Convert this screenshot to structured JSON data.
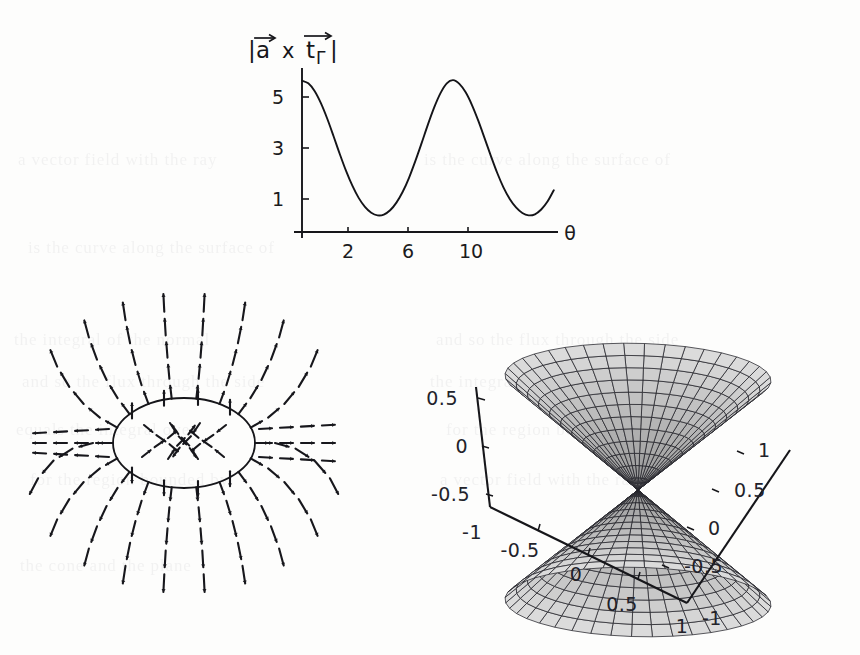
{
  "page": {
    "background_color": "#fdfdfc",
    "ink_color": "#16161a",
    "width": 860,
    "height": 655,
    "kind": "scanned-textbook-page-figures"
  },
  "ghost_text": {
    "note": "illegible show-through text from the reverse side of the scanned page",
    "lines": [
      "a vector field with the ray",
      "is the curve along the surface of",
      "the integral of the normal",
      "and so the flux through the side",
      "equals the integral over",
      "for the region bounded by",
      "the cone and the plane"
    ]
  },
  "figures": {
    "line_plot": {
      "id": "magnitude-plot",
      "title": "|a x t_Gamma|",
      "title_parts": {
        "left_bar": "|",
        "a": "a",
        "cross": "x",
        "t": "t",
        "gamma": "Γ",
        "right_bar": "|"
      },
      "xlabel": "θ",
      "ylabel": "",
      "x_ticks": [
        "2",
        "6",
        "10"
      ],
      "y_ticks": [
        "1",
        "3",
        "5"
      ]
    },
    "vector_field": {
      "id": "vector-field-around-ring",
      "description": "dashed arrow field lines radiating from an elliptical ring",
      "shape": "ellipse"
    },
    "surface_3d": {
      "id": "double-cone-surface",
      "description": "mesh double cone / hourglass surface",
      "z_axis_ticks": [
        "0.5",
        "0",
        "-0.5",
        "-1"
      ],
      "x_axis_ticks": [
        "-0.5",
        "0",
        "0.5",
        "1"
      ],
      "y_axis_ticks": [
        "-1",
        "-0.5",
        "0",
        "0.5",
        "1"
      ],
      "mesh_fill_color": "#c9c9c9",
      "mesh_line_color": "#23232a"
    }
  },
  "chart_data": {
    "type": "line",
    "xlabel": "θ",
    "ylabel": "",
    "xlim": [
      0,
      12.2
    ],
    "ylim": [
      0,
      6.2
    ],
    "x_ticks": [
      2,
      6,
      10
    ],
    "y_ticks": [
      1,
      3,
      5
    ],
    "grid": false,
    "legend": false,
    "series": [
      {
        "name": "|a x t_Γ|",
        "x": [
          0.0,
          0.3,
          0.6,
          0.9,
          1.2,
          1.5,
          1.8,
          2.1,
          2.4,
          2.7,
          3.0,
          3.3,
          3.6,
          3.9,
          4.2,
          4.5,
          4.8,
          5.1,
          5.4,
          5.7,
          6.0,
          6.3,
          6.6,
          6.9,
          7.2,
          7.5,
          7.8,
          8.1,
          8.4,
          8.7,
          9.0,
          9.3,
          9.6,
          9.9,
          10.2,
          10.5,
          10.8,
          11.1,
          11.4,
          11.7,
          12.0
        ],
        "y": [
          5.72,
          5.62,
          5.33,
          4.87,
          4.29,
          3.63,
          2.95,
          2.31,
          1.75,
          1.29,
          0.95,
          0.73,
          0.63,
          0.66,
          0.82,
          1.11,
          1.52,
          2.05,
          2.68,
          3.36,
          4.06,
          4.71,
          5.25,
          5.62,
          5.74,
          5.6,
          5.28,
          4.8,
          4.21,
          3.55,
          2.88,
          2.24,
          1.69,
          1.25,
          0.93,
          0.72,
          0.63,
          0.67,
          0.85,
          1.15,
          1.58
        ]
      }
    ]
  }
}
